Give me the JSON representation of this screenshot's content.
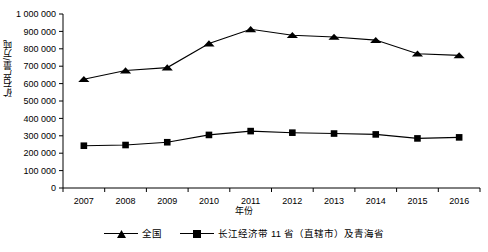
{
  "chart_data": {
    "type": "line",
    "title": "",
    "xlabel": "年份",
    "ylabel": "矿石产量/万吨",
    "categories": [
      "2007",
      "2008",
      "2009",
      "2010",
      "2011",
      "2012",
      "2013",
      "2014",
      "2015",
      "2016"
    ],
    "ylim": [
      0,
      1000000
    ],
    "yticks": [
      "0",
      "100 000",
      "200 000",
      "300 000",
      "400 000",
      "500 000",
      "600 000",
      "700 000",
      "800 000",
      "900 000",
      "1 000 000"
    ],
    "ytick_values": [
      0,
      100000,
      200000,
      300000,
      400000,
      500000,
      600000,
      700000,
      800000,
      900000,
      1000000
    ],
    "grid": false,
    "legend_position": "bottom",
    "series": [
      {
        "name": "全国",
        "marker": "triangle",
        "color": "#000000",
        "values": [
          625000,
          675000,
          692000,
          830000,
          912000,
          878000,
          868000,
          850000,
          772000,
          762000
        ]
      },
      {
        "name": "长江经济带11省（直辖市）及青海省",
        "marker": "square",
        "color": "#000000",
        "values": [
          243000,
          247000,
          263000,
          305000,
          327000,
          318000,
          313000,
          308000,
          285000,
          291000
        ]
      }
    ]
  },
  "legend": [
    {
      "label": "全国",
      "marker": "triangle"
    },
    {
      "label": "长江经济带 11 省（直辖市）及青海省",
      "marker": "square"
    }
  ],
  "axis": {
    "x_title": "年份",
    "y_title": "矿石产量/万吨"
  }
}
